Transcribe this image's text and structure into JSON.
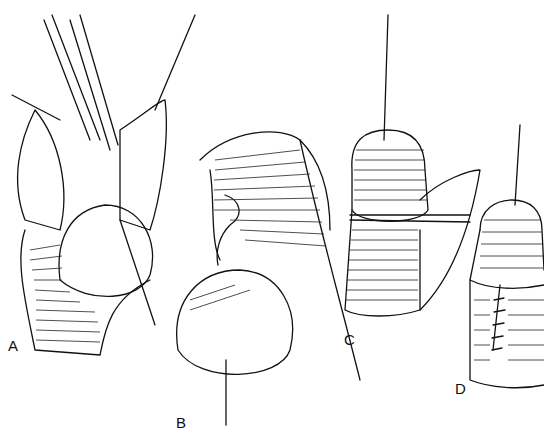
{
  "figure": {
    "panels": [
      {
        "id": "A",
        "label": "A",
        "description": "retracted prepuce with exposed glans and traction suture"
      },
      {
        "id": "B",
        "label": "B",
        "description": "glans pulled down with tissue flap reflected"
      },
      {
        "id": "C",
        "label": "C",
        "description": "glans with suture, lateral incision being closed"
      },
      {
        "id": "D",
        "label": "D",
        "description": "completed closure with interrupted sutures along shaft"
      }
    ]
  }
}
